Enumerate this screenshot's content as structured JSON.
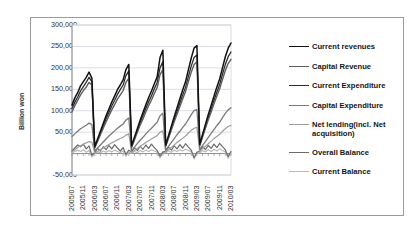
{
  "chart_data": {
    "type": "line",
    "title": "",
    "xlabel": "",
    "ylabel": "Billion won",
    "ylim": [
      -50000,
      300000
    ],
    "ytick_labels": [
      "300,000",
      "250,000",
      "200,000",
      "150,000",
      "100,000",
      "50,000",
      "0",
      "-50,000"
    ],
    "ytick_values": [
      300000,
      250000,
      200000,
      150000,
      100000,
      50000,
      0,
      -50000
    ],
    "grid": true,
    "legend_position": "right",
    "x_tick_labels": [
      "2005/07",
      "2005/11",
      "2006/03",
      "2006/07",
      "2006/11",
      "2007/03",
      "2007/07",
      "2007/11",
      "2008/03",
      "2008/07",
      "2008/11",
      "2009/03",
      "2009/07",
      "2009/11",
      "2010/03"
    ],
    "x": [
      "2005/07",
      "2005/08",
      "2005/09",
      "2005/10",
      "2005/11",
      "2005/12",
      "2006/01",
      "2006/02",
      "2006/03",
      "2006/04",
      "2006/05",
      "2006/06",
      "2006/07",
      "2006/08",
      "2006/09",
      "2006/10",
      "2006/11",
      "2006/12",
      "2007/01",
      "2007/02",
      "2007/03",
      "2007/04",
      "2007/05",
      "2007/06",
      "2007/07",
      "2007/08",
      "2007/09",
      "2007/10",
      "2007/11",
      "2007/12",
      "2008/01",
      "2008/02",
      "2008/03",
      "2008/04",
      "2008/05",
      "2008/06",
      "2008/07",
      "2008/08",
      "2008/09",
      "2008/10",
      "2008/11",
      "2008/12",
      "2009/01",
      "2009/02",
      "2009/03",
      "2009/04",
      "2009/05",
      "2009/06",
      "2009/07",
      "2009/08",
      "2009/09",
      "2009/10",
      "2009/11",
      "2009/12",
      "2010/01",
      "2010/02",
      "2010/03"
    ],
    "series": [
      {
        "name": "Current revenues",
        "color": "#111111",
        "width": 1.5,
        "values": [
          113000,
          130000,
          142000,
          158000,
          168000,
          178000,
          190000,
          176000,
          16000,
          34000,
          52000,
          70000,
          88000,
          104000,
          120000,
          134000,
          149000,
          160000,
          172000,
          196000,
          208000,
          18000,
          38000,
          58000,
          78000,
          96000,
          114000,
          131000,
          146000,
          163000,
          179000,
          224000,
          241000,
          20000,
          42000,
          64000,
          86000,
          107000,
          128000,
          149000,
          168000,
          196000,
          223000,
          246000,
          252000,
          22000,
          45000,
          68000,
          91000,
          112000,
          134000,
          155000,
          174000,
          200000,
          226000,
          246000,
          258000
        ]
      },
      {
        "name": "Capital Revenue",
        "color": "#5e5e5e",
        "width": 1.4,
        "values": [
          97000,
          112000,
          124000,
          137000,
          147000,
          155000,
          166000,
          160000,
          13000,
          28000,
          44000,
          59000,
          74000,
          88000,
          102000,
          114000,
          127000,
          137000,
          147000,
          166000,
          176000,
          15000,
          32000,
          49000,
          66000,
          81000,
          97000,
          112000,
          125000,
          140000,
          154000,
          184000,
          196000,
          17000,
          36000,
          55000,
          74000,
          92000,
          110000,
          128000,
          145000,
          168000,
          190000,
          208000,
          214000,
          19000,
          39000,
          59000,
          79000,
          97000,
          116000,
          134000,
          151000,
          173000,
          194000,
          210000,
          220000
        ]
      },
      {
        "name": "Current Expenditure",
        "color": "#2c2c2c",
        "width": 1.3,
        "values": [
          105000,
          120000,
          132000,
          146000,
          156000,
          166000,
          178000,
          168000,
          14000,
          31000,
          48000,
          64000,
          81000,
          96000,
          111000,
          124000,
          138000,
          149000,
          160000,
          182000,
          193000,
          16000,
          35000,
          53000,
          72000,
          88000,
          105000,
          121000,
          135000,
          151000,
          166000,
          200000,
          214000,
          18000,
          38000,
          59000,
          79000,
          98000,
          118000,
          137000,
          155000,
          180000,
          204000,
          224000,
          230000,
          20000,
          42000,
          63000,
          84000,
          103000,
          124000,
          143000,
          161000,
          185000,
          208000,
          226000,
          237000
        ]
      },
      {
        "name": "Capital Expenditure",
        "color": "#7a7a7a",
        "width": 1.3,
        "values": [
          40000,
          46000,
          52000,
          58000,
          62000,
          66000,
          71000,
          68000,
          6000,
          13000,
          20000,
          27000,
          34000,
          41000,
          47000,
          53000,
          59000,
          64000,
          69000,
          78000,
          83000,
          7000,
          15000,
          23000,
          31000,
          38000,
          46000,
          53000,
          59000,
          66000,
          73000,
          88000,
          94000,
          8000,
          17000,
          26000,
          35000,
          44000,
          52000,
          61000,
          69000,
          80000,
          91000,
          100000,
          103000,
          9000,
          19000,
          28000,
          38000,
          47000,
          56000,
          65000,
          73000,
          84000,
          94000,
          102000,
          107000
        ]
      },
      {
        "name": "Net lending(incl. Net acquisition)",
        "color": "#9e9e9e",
        "width": 1.2,
        "values": [
          4000,
          9000,
          14000,
          18000,
          22000,
          25000,
          28000,
          26000,
          2000,
          5000,
          9000,
          13000,
          17000,
          21000,
          25000,
          28000,
          32000,
          35000,
          38000,
          43000,
          46000,
          3000,
          7000,
          12000,
          17000,
          21000,
          26000,
          30000,
          34000,
          38000,
          42000,
          50000,
          53000,
          4000,
          9000,
          15000,
          20000,
          26000,
          31000,
          36000,
          41000,
          48000,
          54000,
          59000,
          61000,
          5000,
          11000,
          17000,
          23000,
          29000,
          35000,
          40000,
          45000,
          52000,
          58000,
          63000,
          66000
        ]
      },
      {
        "name": "Overall Balance",
        "color": "#6b6b6b",
        "width": 1.2,
        "values": [
          6000,
          13000,
          20000,
          16000,
          22000,
          11000,
          18000,
          -4000,
          3000,
          12000,
          6000,
          16000,
          9000,
          19000,
          11000,
          21000,
          13000,
          6000,
          14000,
          -2000,
          8000,
          4000,
          14000,
          7000,
          17000,
          10000,
          20000,
          12000,
          22000,
          14000,
          7000,
          -6000,
          4000,
          5000,
          15000,
          8000,
          18000,
          11000,
          21000,
          13000,
          23000,
          15000,
          8000,
          -9000,
          3000,
          6000,
          17000,
          9000,
          19000,
          12000,
          22000,
          14000,
          24000,
          16000,
          9000,
          -7000,
          5000
        ]
      },
      {
        "name": "Current Balance",
        "color": "#b9b9b9",
        "width": 1.2,
        "values": [
          2000,
          5000,
          8000,
          5000,
          9000,
          3000,
          7000,
          -8000,
          1000,
          4000,
          2000,
          6000,
          3000,
          7000,
          4000,
          8000,
          5000,
          2000,
          6000,
          -6000,
          3000,
          1000,
          5000,
          2000,
          7000,
          4000,
          8000,
          5000,
          9000,
          6000,
          3000,
          -10000,
          2000,
          2000,
          6000,
          3000,
          8000,
          5000,
          9000,
          6000,
          10000,
          7000,
          4000,
          -13000,
          1000,
          2000,
          7000,
          4000,
          9000,
          5000,
          10000,
          6000,
          11000,
          7000,
          4000,
          -11000,
          2000
        ]
      }
    ]
  },
  "axis_style": {
    "grid_color": "#c8cfd8",
    "axis_color": "#808080",
    "frame_color": "#9a9a9a",
    "zero_line_color": "#808080"
  }
}
